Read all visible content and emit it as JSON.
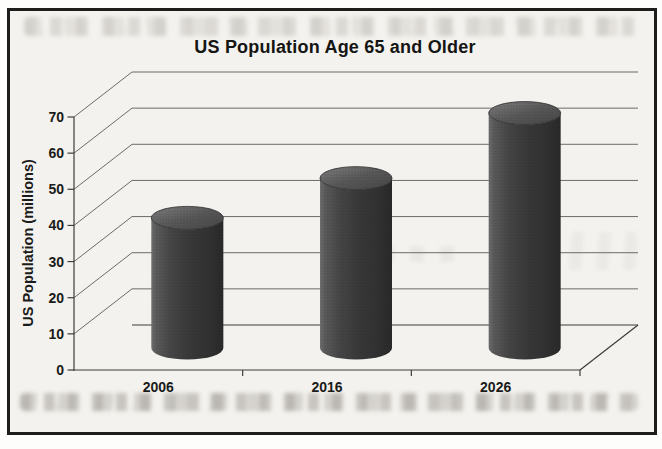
{
  "chart_data": {
    "type": "bar",
    "bar_style": "3d-cylinder",
    "title": "US Population Age 65 and Older",
    "xlabel": "",
    "ylabel": "US Population (millions)",
    "categories": [
      "2006",
      "2016",
      "2026"
    ],
    "values": [
      36,
      47,
      65
    ],
    "yticks": [
      0,
      10,
      20,
      30,
      40,
      50,
      60,
      70
    ],
    "ylim": [
      0,
      70
    ],
    "grid": true,
    "legend": false
  },
  "colors": {
    "cylinder_body": "#3a3a3a",
    "cylinder_top": "#5c5c5c",
    "gridline": "#6b6b6b",
    "axis": "#3c3c3c",
    "text": "#1b1b19",
    "paper": "#f4f2ee",
    "frame_border": "#1d1d1b"
  }
}
